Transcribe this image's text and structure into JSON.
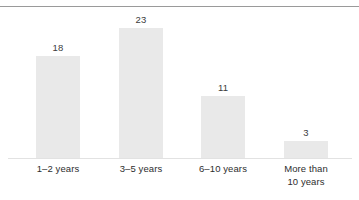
{
  "chart_data": {
    "type": "bar",
    "title": "",
    "subtitle": "",
    "xlabel": "",
    "ylabel": "",
    "grid": false,
    "legend": null,
    "ylim": [
      0,
      25
    ],
    "categories": [
      "1–2 years",
      "3–5 years",
      "6–10 years",
      "More than 10 years"
    ],
    "category_lines": [
      [
        "1–2 years"
      ],
      [
        "3–5 years"
      ],
      [
        "6–10 years"
      ],
      [
        "More than",
        "10 years"
      ]
    ],
    "values": [
      18,
      23,
      11,
      3
    ],
    "value_labels": [
      "18",
      "23",
      "11",
      "3"
    ],
    "bar_color": "#e9e9e9",
    "label_color": "#3c3c3c",
    "axis_color": "#e2e2e2",
    "rule_color": "#9a9a9a",
    "background": "#ffffff"
  }
}
